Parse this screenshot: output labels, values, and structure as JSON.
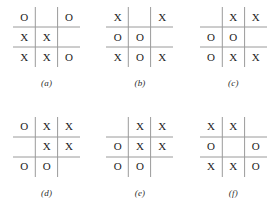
{
  "figure": {
    "type": "tic-tac-toe-board-set",
    "rows": 2,
    "columns": 3,
    "line_color": "#9a9a9a",
    "mark_color": "#222222",
    "background_color": "#ffffff",
    "empty_mark": "",
    "boards": [
      {
        "caption": "(a)",
        "cells": [
          [
            "O",
            "",
            "O"
          ],
          [
            "X",
            "X",
            ""
          ],
          [
            "X",
            "X",
            "O"
          ]
        ]
      },
      {
        "caption": "(b)",
        "cells": [
          [
            "X",
            "",
            "X"
          ],
          [
            "O",
            "O",
            ""
          ],
          [
            "X",
            "O",
            "X"
          ]
        ]
      },
      {
        "caption": "(c)",
        "cells": [
          [
            "",
            "X",
            "X"
          ],
          [
            "O",
            "O",
            ""
          ],
          [
            "O",
            "X",
            "X"
          ]
        ]
      },
      {
        "caption": "(d)",
        "cells": [
          [
            "O",
            "X",
            "X"
          ],
          [
            "",
            "X",
            "X"
          ],
          [
            "O",
            "O",
            ""
          ]
        ]
      },
      {
        "caption": "(e)",
        "cells": [
          [
            "",
            "X",
            "X"
          ],
          [
            "O",
            "X",
            "X"
          ],
          [
            "O",
            "O",
            ""
          ]
        ]
      },
      {
        "caption": "(f)",
        "cells": [
          [
            "X",
            "X",
            ""
          ],
          [
            "O",
            "",
            "O"
          ],
          [
            "X",
            "X",
            "O"
          ]
        ]
      }
    ]
  }
}
